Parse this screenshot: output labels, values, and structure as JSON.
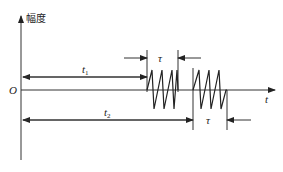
{
  "diagram": {
    "y_axis_label": "幅度",
    "x_axis_label": "t",
    "origin_label": "O",
    "interval_1_label": "t",
    "interval_1_sub": "1",
    "interval_2_label": "t",
    "interval_2_sub": "2",
    "pulse_width_1_label": "τ",
    "pulse_width_2_label": "τ",
    "colors": {
      "line": "#333333",
      "background": "#ffffff"
    }
  }
}
